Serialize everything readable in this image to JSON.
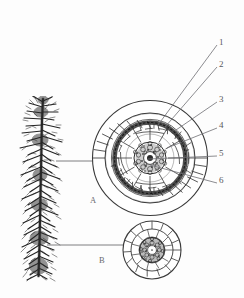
{
  "figure": {
    "background_color": "#fdfdfd",
    "ink_color": "#3a3a3a",
    "leader_color": "#6f6f73"
  },
  "panels": [
    {
      "id": "A",
      "label": "A",
      "caption": "mature root cross-section",
      "x": 90,
      "y": 196
    },
    {
      "id": "B",
      "label": "B",
      "caption": "young root cross-section",
      "x": 99,
      "y": 256
    }
  ],
  "callouts": [
    {
      "number": "1",
      "label": "1",
      "x": 221,
      "y": 43,
      "target_x": 158,
      "target_y": 125
    },
    {
      "number": "2",
      "label": "2",
      "x": 221,
      "y": 65,
      "target_x": 165,
      "target_y": 127
    },
    {
      "number": "3",
      "label": "3",
      "x": 221,
      "y": 100,
      "target_x": 176,
      "target_y": 130
    },
    {
      "number": "4",
      "label": "4",
      "x": 221,
      "y": 126,
      "target_x": 167,
      "target_y": 148
    },
    {
      "number": "5",
      "label": "5",
      "x": 221,
      "y": 154,
      "target_x": 148,
      "target_y": 159
    },
    {
      "number": "6",
      "label": "6",
      "x": 221,
      "y": 181,
      "target_x": 150,
      "target_y": 165
    }
  ],
  "specimen": {
    "name": "fibrous-root-system",
    "description": "taproot with dense lateral rootlets"
  },
  "connectors": [
    {
      "name": "root-to-section-a",
      "from_x": 56,
      "from_y": 161,
      "to_x": 104,
      "to_y": 161
    },
    {
      "name": "root-to-section-b",
      "from_x": 47,
      "from_y": 245,
      "to_x": 131,
      "to_y": 245
    }
  ]
}
